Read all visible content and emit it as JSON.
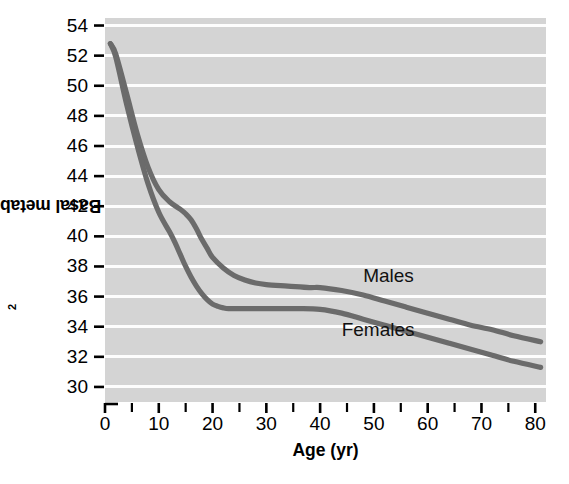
{
  "chart_data": {
    "type": "line",
    "title": "",
    "xlabel": "Age (yr)",
    "ylabel": "Basal metabolism (kcal/m2/hr)",
    "ylabel_parts": {
      "before": "Basal metabolism (kcal/m",
      "sup": "2",
      "after": "/hr)"
    },
    "xlim": [
      0,
      82
    ],
    "ylim": [
      29,
      54.5
    ],
    "grid": "horizontal-white-gridlines-on-gray-panel",
    "legend": "inline-labels-on-curves",
    "x_ticks": [
      0,
      10,
      20,
      30,
      40,
      50,
      60,
      70,
      80
    ],
    "x_tick_labels": [
      "0",
      "10",
      "20",
      "30",
      "40",
      "50",
      "60",
      "70",
      "80"
    ],
    "x_minor_ticks": [
      5,
      15,
      25,
      35,
      45,
      55,
      65,
      75
    ],
    "y_ticks": [
      30,
      32,
      34,
      36,
      38,
      40,
      42,
      44,
      46,
      48,
      50,
      52,
      54
    ],
    "y_tick_labels": [
      "30",
      "32",
      "34",
      "36",
      "38",
      "40",
      "42",
      "44",
      "46",
      "48",
      "50",
      "52",
      "54"
    ],
    "colors": {
      "panel_background": "#d4d4d4",
      "gridline": "#fdfdfd",
      "series_line": "#6b6b6b",
      "text": "#000000"
    },
    "series": [
      {
        "name": "Males",
        "label": "Males",
        "label_position": {
          "x": 48,
          "y": 37.4
        },
        "x": [
          1,
          2,
          4,
          6,
          8,
          10,
          12,
          14,
          15,
          16,
          17,
          18,
          19,
          20,
          22,
          24,
          26,
          28,
          30,
          34,
          38,
          40,
          44,
          48,
          52,
          56,
          60,
          64,
          68,
          72,
          76,
          81
        ],
        "values": [
          52.8,
          52.1,
          49.5,
          46.8,
          44.6,
          43.1,
          42.3,
          41.8,
          41.5,
          41.1,
          40.5,
          39.8,
          39.2,
          38.6,
          37.9,
          37.4,
          37.1,
          36.9,
          36.8,
          36.7,
          36.6,
          36.6,
          36.4,
          36.1,
          35.7,
          35.3,
          34.9,
          34.5,
          34.1,
          33.8,
          33.4,
          33.0
        ]
      },
      {
        "name": "Females",
        "label": "Females",
        "label_position": {
          "x": 44,
          "y": 33.8
        },
        "x": [
          1,
          2,
          4,
          6,
          8,
          10,
          12,
          13,
          14,
          15,
          16,
          17,
          18,
          19,
          20,
          21,
          22,
          23,
          25,
          28,
          32,
          36,
          40,
          44,
          48,
          52,
          56,
          60,
          64,
          68,
          72,
          76,
          81
        ],
        "values": [
          52.8,
          51.9,
          48.8,
          46.0,
          43.5,
          41.6,
          40.3,
          39.6,
          38.8,
          38.0,
          37.3,
          36.7,
          36.2,
          35.8,
          35.5,
          35.35,
          35.25,
          35.2,
          35.2,
          35.2,
          35.2,
          35.2,
          35.15,
          34.9,
          34.5,
          34.1,
          33.7,
          33.3,
          32.9,
          32.5,
          32.1,
          31.7,
          31.3
        ]
      }
    ],
    "notes": {
      "observation": "Both sexes start near 52.8 kcal/m2/hr in infancy, fall steeply through childhood, plateau in adulthood, then decline slowly with age; males remain above females after about age 12."
    }
  }
}
